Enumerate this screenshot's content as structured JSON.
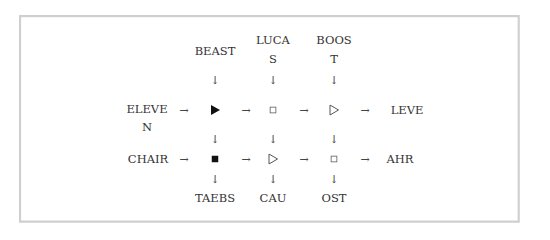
{
  "diagram": {
    "top_labels": [
      {
        "id": "beast",
        "line1": "BEAST",
        "line2": ""
      },
      {
        "id": "lucas",
        "line1": "LUCA",
        "line2": "S"
      },
      {
        "id": "boost",
        "line1": "BOOS",
        "line2": "T"
      }
    ],
    "left_labels": [
      {
        "id": "eleven",
        "line1": "ELEVE",
        "line2": "N"
      },
      {
        "id": "chair",
        "line1": "CHAIR",
        "line2": ""
      }
    ],
    "right_labels": [
      {
        "id": "leve",
        "text": "LEVE"
      },
      {
        "id": "ahr",
        "text": "AHR"
      }
    ],
    "bottom_labels": [
      {
        "id": "taebs",
        "text": "TAEBS"
      },
      {
        "id": "cau",
        "text": "CAU"
      },
      {
        "id": "ost",
        "text": "OST"
      }
    ],
    "grid": [
      [
        "filled-triangle",
        "hollow-square",
        "hollow-triangle"
      ],
      [
        "filled-square",
        "hollow-triangle",
        "hollow-square"
      ]
    ],
    "arrow_right": "→",
    "arrow_down": "↓"
  }
}
